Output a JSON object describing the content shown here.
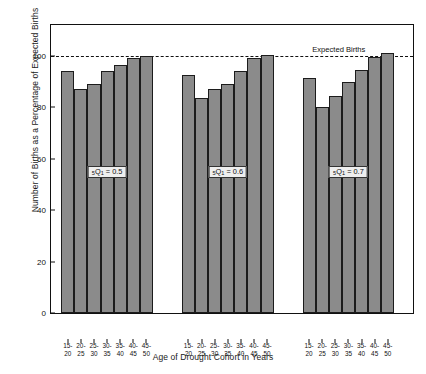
{
  "chart_data": {
    "type": "bar",
    "title": "",
    "xlabel": "Age of Drought Cohort in Years",
    "ylabel": "Number of Births as a Percentage of Expected Births",
    "ylim": [
      0,
      112
    ],
    "yticks": [
      0,
      20,
      40,
      60,
      80,
      100
    ],
    "ytick_labels": [
      "0",
      "20",
      "40",
      "60",
      "80",
      "100"
    ],
    "grid": false,
    "legend_position": "none",
    "categories": [
      "15-20",
      "20-25",
      "25-30",
      "30-35",
      "35-40",
      "40-45",
      "45-50"
    ],
    "reference_line": {
      "label": "Expected Births",
      "value": 100
    },
    "series": [
      {
        "name": "5Q1 = 0.5",
        "label_text": "Q",
        "label_sub": "1",
        "label_pre": "5",
        "label_value": "= 0.5",
        "values": [
          94,
          87,
          89,
          94,
          96.5,
          99,
          100
        ]
      },
      {
        "name": "5Q1 = 0.6",
        "label_text": "Q",
        "label_sub": "1",
        "label_pre": "5",
        "label_value": "= 0.6",
        "values": [
          92.5,
          83.5,
          87,
          89,
          94,
          99,
          100.5
        ]
      },
      {
        "name": "5Q1 = 0.7",
        "label_text": "Q",
        "label_sub": "1",
        "label_pre": "5",
        "label_value": "= 0.7",
        "values": [
          91.5,
          80,
          84.5,
          90,
          94.5,
          99.5,
          101
        ]
      }
    ]
  }
}
